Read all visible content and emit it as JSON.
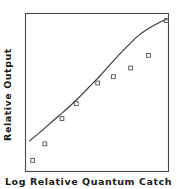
{
  "figure": {
    "width": 177,
    "height": 189,
    "background": "#ffffff",
    "frame_color": "#4a4a4a",
    "curve_color": "#3a3a3a",
    "marker_color": "#555555"
  },
  "chart_data": {
    "type": "scatter",
    "title": "",
    "subtitle": "",
    "xlabel": "Log Relative Quantum Catch",
    "ylabel": "Relative Output",
    "xlim": [
      0,
      10
    ],
    "ylim": [
      0,
      10
    ],
    "xticks": [],
    "yticks": [],
    "xticklabels": [],
    "yticklabels": [],
    "grid": false,
    "legend": false,
    "legend_position": "none",
    "annotations": [],
    "series": [
      {
        "name": "Observed data",
        "marker": "open-square",
        "x": [
          0.5,
          1.35,
          2.55,
          3.55,
          5.05,
          6.15,
          7.35,
          8.6,
          9.85
        ],
        "y": [
          0.7,
          1.75,
          3.35,
          4.3,
          5.6,
          6.0,
          6.55,
          7.35,
          9.55
        ]
      },
      {
        "name": "Fitted curve",
        "marker": "none",
        "x": [
          0.3,
          0.9,
          1.6,
          2.3,
          3.0,
          3.7,
          4.4,
          5.1,
          5.8,
          6.5,
          7.2,
          7.9,
          8.6,
          9.3,
          9.9
        ],
        "y": [
          1.95,
          2.4,
          2.95,
          3.5,
          4.05,
          4.65,
          5.3,
          5.95,
          6.65,
          7.35,
          8.0,
          8.6,
          9.05,
          9.4,
          9.65
        ]
      }
    ]
  }
}
